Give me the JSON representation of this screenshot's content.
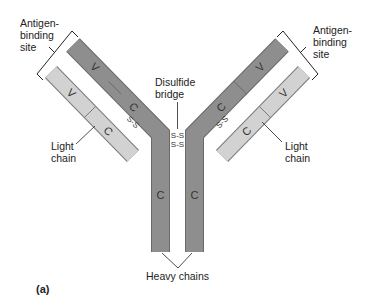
{
  "figure": {
    "panel_label": "(a)",
    "colors": {
      "heavy_chain": "#8e8e8e",
      "light_chain": "#d2d2d2",
      "outline": "#6a6a6a",
      "text": "#222222"
    }
  },
  "labels": {
    "antigen_left": [
      "Antigen-",
      "binding",
      "site"
    ],
    "antigen_right": [
      "Antigen-",
      "binding",
      "site"
    ],
    "disulfide": [
      "Disulfide",
      "bridge"
    ],
    "light_left": [
      "Light",
      "chain"
    ],
    "light_right": [
      "Light",
      "chain"
    ],
    "heavy": "Heavy chains"
  },
  "regions": {
    "variable": "V",
    "constant": "C"
  },
  "bonds": {
    "interchain": "S-S"
  }
}
